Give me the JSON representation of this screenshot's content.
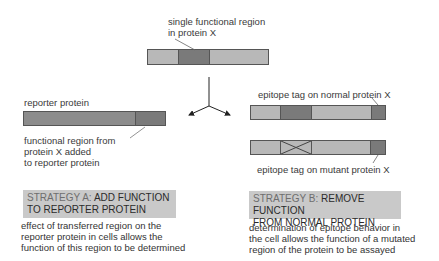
{
  "top": {
    "label_line1": "single functional region",
    "label_line2": "in protein X",
    "segments": [
      "light",
      "dark",
      "light"
    ]
  },
  "strategy_a": {
    "bar_label": "reporter protein",
    "callout_line1": "functional region from",
    "callout_line2": "protein X added",
    "callout_line3": "to reporter protein",
    "title_prefix": "STRATEGY A:",
    "title_line1_rest": "ADD FUNCTION",
    "title_line2": "TO REPORTER PROTEIN",
    "desc_line1": "effect of transferred region on the",
    "desc_line2": "reporter protein in cells allows the",
    "desc_line3": "function of this region to be determined"
  },
  "strategy_b": {
    "normal_label": "epitope tag on normal protein X",
    "mutant_label": "epitope tag on mutant protein X",
    "title_prefix": "STRATEGY B:",
    "title_line1_rest": "REMOVE FUNCTION",
    "title_line2": "FROM NORMAL PROTEIN",
    "desc_line1": "determination of epitope behavior in",
    "desc_line2": "the cell allows the function of a mutated",
    "desc_line3": "region of the protein to be assayed"
  },
  "colors": {
    "light_region": "#b8b8b8",
    "dark_region": "#7a7a7a",
    "strategy_box": "#c9c9c9"
  }
}
